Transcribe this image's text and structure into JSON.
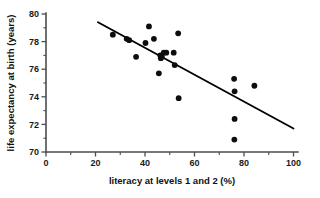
{
  "chart_data": {
    "type": "scatter",
    "title": "",
    "xlabel": "literacy at levels 1 and 2 (%)",
    "ylabel": "life expectancy at birth (years)",
    "xlim": [
      0,
      100
    ],
    "ylim": [
      70,
      80
    ],
    "xticks": [
      0,
      20,
      40,
      60,
      80,
      100
    ],
    "yticks": [
      70,
      72,
      74,
      76,
      78,
      80
    ],
    "xtick_labels": [
      "0",
      "20",
      "40",
      "60",
      "80",
      "100"
    ],
    "ytick_labels": [
      "70",
      "72",
      "74",
      "76",
      "78",
      "80"
    ],
    "x_minor_tick_step": 10,
    "y_minor_tick_step": 1,
    "grid": false,
    "legend": false,
    "points": [
      {
        "x": 27.0,
        "y": 78.5
      },
      {
        "x": 32.6,
        "y": 78.2
      },
      {
        "x": 33.6,
        "y": 78.1
      },
      {
        "x": 36.4,
        "y": 76.9
      },
      {
        "x": 40.2,
        "y": 77.9
      },
      {
        "x": 41.6,
        "y": 79.1
      },
      {
        "x": 43.6,
        "y": 78.2
      },
      {
        "x": 45.6,
        "y": 75.7
      },
      {
        "x": 46.2,
        "y": 77.0
      },
      {
        "x": 46.4,
        "y": 76.8
      },
      {
        "x": 46.8,
        "y": 76.9
      },
      {
        "x": 47.6,
        "y": 77.2
      },
      {
        "x": 48.6,
        "y": 77.2
      },
      {
        "x": 51.6,
        "y": 77.2
      },
      {
        "x": 52.0,
        "y": 76.3
      },
      {
        "x": 53.4,
        "y": 78.6
      },
      {
        "x": 53.6,
        "y": 73.9
      },
      {
        "x": 76.0,
        "y": 75.3
      },
      {
        "x": 76.2,
        "y": 74.4
      },
      {
        "x": 76.2,
        "y": 72.4
      },
      {
        "x": 76.1,
        "y": 70.9
      },
      {
        "x": 84.2,
        "y": 74.8
      }
    ],
    "trendline": {
      "name": "linear fit",
      "x_start": 21.0,
      "y_start": 79.4,
      "x_end": 100.0,
      "y_end": 71.7
    }
  }
}
